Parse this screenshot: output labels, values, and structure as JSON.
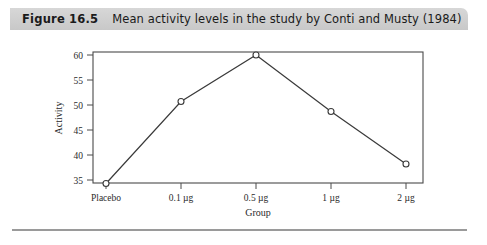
{
  "caption": {
    "number": "Figure 16.5",
    "text": "Mean activity levels in the study by Conti and Musty (1984)"
  },
  "chart_data": {
    "type": "line",
    "title": "Mean activity levels in the study by Conti and Musty (1984)",
    "xlabel": "Group",
    "ylabel": "Activity",
    "categories": [
      "Placebo",
      "0.1 µg",
      "0.5 µg",
      "1 µg",
      "2 µg"
    ],
    "values": [
      34.3,
      50.7,
      60.0,
      48.7,
      38.2
    ],
    "xticklabels": [
      "Placebo",
      "0.1 µg",
      "0.5 µg",
      "1 µg",
      "2 µg"
    ],
    "yticklabels": [
      "35",
      "40",
      "45",
      "50",
      "55",
      "60"
    ],
    "yticks": [
      35,
      40,
      45,
      50,
      55,
      60
    ],
    "ylim": [
      32.2,
      61.5
    ],
    "grid": false,
    "legend": null,
    "marker": "open-circle",
    "line_color": "#3a3a3a",
    "marker_color": "#3a3a3a",
    "axis_color": "#4a4a4a"
  },
  "colors": {
    "caption_band": "#d0d0d0",
    "rule": "#9a9a9a",
    "background": "#ffffff"
  }
}
